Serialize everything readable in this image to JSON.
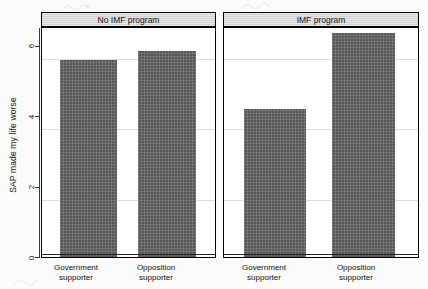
{
  "chart_data": {
    "type": "bar",
    "title": "",
    "subtitle": "",
    "xlabel": "",
    "ylabel": "SAP made my life worse",
    "ylim": [
      0,
      7
    ],
    "yticks": [
      0,
      2,
      4,
      6
    ],
    "grid": true,
    "legend": "none",
    "panel_variable": "IMF program status",
    "categories": [
      "Government supporter",
      "Opposition supporter"
    ],
    "panels": [
      {
        "label": "No IMF program",
        "categories": [
          "Government supporter",
          "Opposition supporter"
        ],
        "values": [
          5.6,
          5.85
        ]
      },
      {
        "label": "IMF program",
        "categories": [
          "Government supporter",
          "Opposition supporter"
        ],
        "values": [
          4.2,
          6.35
        ]
      }
    ],
    "series": [
      {
        "name": "No IMF program",
        "values": [
          5.6,
          5.85
        ]
      },
      {
        "name": "IMF program",
        "values": [
          4.2,
          6.35
        ]
      }
    ],
    "bar_color": "#585858",
    "strip_color": "#d4d4d4",
    "grid_color": "#dcdcdc",
    "axis_color": "#3a3a3a"
  },
  "axis": {
    "y_title": "SAP made my life worse",
    "tick_labels": [
      "0",
      "2",
      "4",
      "6"
    ]
  },
  "panels": {
    "left_title": "No IMF program",
    "right_title": "IMF program"
  },
  "xlabels": {
    "government_line1": "Government",
    "government_line2": "supporter",
    "opposition_line1": "Opposition",
    "opposition_line2": "supporter"
  }
}
